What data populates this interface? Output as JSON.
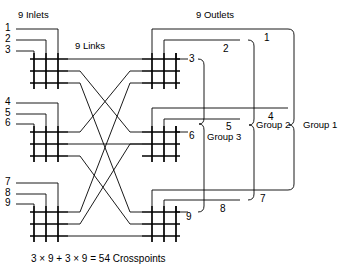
{
  "figure": {
    "title_left": "9 Inlets",
    "title_right": "9 Outlets",
    "links_label": "9 Links",
    "caption": "3 × 9 + 3 × 9 = 54 Crosspoints",
    "line_color": "#000000",
    "background": "#ffffff"
  },
  "inlets": {
    "count": 9,
    "labels": [
      "1",
      "2",
      "3",
      "4",
      "5",
      "6",
      "7",
      "8",
      "9"
    ]
  },
  "outlets": {
    "count": 9,
    "labels": [
      "1",
      "2",
      "3",
      "4",
      "5",
      "6",
      "7",
      "8",
      "9"
    ]
  },
  "groups": [
    {
      "label": "Group 1",
      "level": 1
    },
    {
      "label": "Group 2",
      "level": 2
    },
    {
      "label": "Group 3",
      "level": 3
    }
  ],
  "matrices": {
    "input_stage": [
      {
        "name": "input-matrix-1",
        "rows": 3,
        "cols": 3,
        "inlets": [
          "1",
          "2",
          "3"
        ]
      },
      {
        "name": "input-matrix-2",
        "rows": 3,
        "cols": 3,
        "inlets": [
          "4",
          "5",
          "6"
        ]
      },
      {
        "name": "input-matrix-3",
        "rows": 3,
        "cols": 3,
        "inlets": [
          "7",
          "8",
          "9"
        ]
      }
    ],
    "output_stage": [
      {
        "name": "output-matrix-1",
        "rows": 3,
        "cols": 3,
        "outlets": [
          "1",
          "2",
          "3"
        ]
      },
      {
        "name": "output-matrix-2",
        "rows": 3,
        "cols": 3,
        "outlets": [
          "4",
          "5",
          "6"
        ]
      },
      {
        "name": "output-matrix-3",
        "rows": 3,
        "cols": 3,
        "outlets": [
          "7",
          "8",
          "9"
        ]
      }
    ],
    "links_count": 9,
    "crosspoints_total": 54
  }
}
